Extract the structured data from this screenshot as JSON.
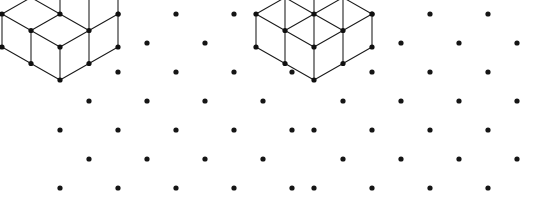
{
  "figure_panels": [
    {
      "id": "iii",
      "label": "(iii)",
      "description": "isometric dot-lattice drawing of a stack of unit cubes",
      "cube_count": 6,
      "dot_grid": {
        "cols": 5,
        "rows": 7,
        "x_spacing": 58,
        "y_spacing": 29,
        "origin_x": 60,
        "origin_y": 14,
        "dot_radius": 2.6,
        "dot_color": "#151515",
        "pattern": "isometric-triangular"
      },
      "geometry": {
        "origin_x": 60,
        "origin_y": 14,
        "half_w": 29,
        "half_h": 16.5,
        "cube_h": 33,
        "cells": [
          {
            "gx": 0,
            "gy": 0,
            "gz": 0
          },
          {
            "gx": 1,
            "gy": 0,
            "gz": 0
          },
          {
            "gx": 0,
            "gy": 1,
            "gz": 0
          },
          {
            "gx": 1,
            "gy": 1,
            "gz": 0
          },
          {
            "gx": 0,
            "gy": 0,
            "gz": 1
          },
          {
            "gx": 1,
            "gy": 0,
            "gz": 1
          }
        ]
      },
      "stroke_color": "#1a1a1a",
      "stroke_width": 1.05
    },
    {
      "id": "iv",
      "label": "(iv)",
      "description": "isometric dot-lattice drawing of a stack of unit cubes with a step",
      "cube_count": 6,
      "dot_grid": {
        "cols": 5,
        "rows": 7,
        "x_spacing": 58,
        "y_spacing": 29,
        "origin_x": 314,
        "origin_y": 14,
        "dot_radius": 2.6,
        "dot_color": "#151515",
        "pattern": "isometric-triangular"
      },
      "geometry": {
        "origin_x": 314,
        "origin_y": 14,
        "half_w": 29,
        "half_h": 16.5,
        "cube_h": 33,
        "cells": [
          {
            "gx": 0,
            "gy": 0,
            "gz": 0
          },
          {
            "gx": 1,
            "gy": 0,
            "gz": 0
          },
          {
            "gx": 0,
            "gy": 1,
            "gz": 0
          },
          {
            "gx": 1,
            "gy": 1,
            "gz": 0
          },
          {
            "gx": 0,
            "gy": 0,
            "gz": 1
          },
          {
            "gx": 1,
            "gy": 1,
            "gz": 1
          }
        ]
      },
      "stroke_color": "#1a1a1a",
      "stroke_width": 1.05
    }
  ],
  "canvas": {
    "width": 546,
    "height": 201,
    "background": "#ffffff"
  }
}
